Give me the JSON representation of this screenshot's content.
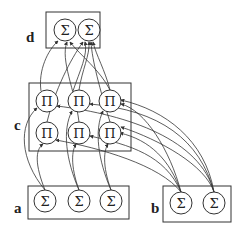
{
  "diagram": {
    "title": "",
    "groups": [
      {
        "id": "d",
        "label": "d",
        "node_symbol": "Σ",
        "node_type": "sum",
        "nodes": [
          "d1",
          "d2"
        ]
      },
      {
        "id": "c",
        "label": "c",
        "node_symbol": "Π",
        "node_type": "product",
        "nodes": [
          "c1",
          "c2",
          "c3",
          "c4",
          "c5",
          "c6"
        ]
      },
      {
        "id": "a",
        "label": "a",
        "node_symbol": "Σ",
        "node_type": "sum",
        "nodes": [
          "a1",
          "a2",
          "a3"
        ]
      },
      {
        "id": "b",
        "label": "b",
        "node_symbol": "Σ",
        "node_type": "sum",
        "nodes": [
          "b1",
          "b2"
        ]
      }
    ],
    "nodes": {
      "d1": "Σ",
      "d2": "Σ",
      "c1": "Π",
      "c2": "Π",
      "c3": "Π",
      "c4": "Π",
      "c5": "Π",
      "c6": "Π",
      "a1": "Σ",
      "a2": "Σ",
      "a3": "Σ",
      "b1": "Σ",
      "b2": "Σ"
    },
    "edges_description": "Directed arcs: sum nodes in a and b feed product nodes in c; product nodes in c feed sum nodes in d."
  }
}
